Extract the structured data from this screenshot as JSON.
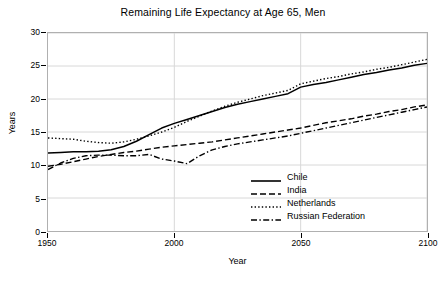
{
  "chart_data": {
    "type": "line",
    "title": "Remaining Life Expectancy at Age 65, Men",
    "xlabel": "Year",
    "ylabel": "Years",
    "xlim": [
      1950,
      2100
    ],
    "ylim": [
      0,
      30
    ],
    "xticks": [
      1950,
      2000,
      2050,
      2100
    ],
    "yticks": [
      0,
      5,
      10,
      15,
      20,
      25,
      30
    ],
    "grid": true,
    "legend_position": "lower right",
    "x": [
      1950,
      1955,
      1960,
      1965,
      1970,
      1975,
      1980,
      1985,
      1990,
      1995,
      2000,
      2005,
      2010,
      2015,
      2020,
      2025,
      2030,
      2035,
      2040,
      2045,
      2050,
      2055,
      2060,
      2065,
      2070,
      2075,
      2080,
      2085,
      2090,
      2095,
      2100
    ],
    "series": [
      {
        "name": "Chile",
        "style": "solid",
        "color": "#000000",
        "values": [
          11.8,
          11.9,
          12.0,
          12.0,
          12.1,
          12.3,
          12.8,
          13.6,
          14.6,
          15.6,
          16.3,
          16.9,
          17.5,
          18.1,
          18.7,
          19.2,
          19.6,
          20.0,
          20.4,
          20.8,
          21.8,
          22.2,
          22.5,
          22.9,
          23.3,
          23.7,
          24.0,
          24.4,
          24.7,
          25.1,
          25.4
        ]
      },
      {
        "name": "India",
        "style": "dashed",
        "color": "#000000",
        "values": [
          9.8,
          10.1,
          10.5,
          10.9,
          11.3,
          11.6,
          11.9,
          12.1,
          12.4,
          12.7,
          12.9,
          13.1,
          13.3,
          13.5,
          13.8,
          14.1,
          14.4,
          14.7,
          15.0,
          15.3,
          15.6,
          16.0,
          16.4,
          16.7,
          17.0,
          17.4,
          17.7,
          18.1,
          18.4,
          18.8,
          19.1
        ]
      },
      {
        "name": "Netherlands",
        "style": "dotted",
        "color": "#000000",
        "values": [
          14.1,
          14.0,
          13.9,
          13.6,
          13.4,
          13.3,
          13.5,
          13.9,
          14.4,
          15.0,
          15.7,
          16.6,
          17.4,
          18.2,
          18.9,
          19.5,
          20.0,
          20.5,
          20.9,
          21.3,
          22.3,
          22.7,
          23.1,
          23.4,
          23.8,
          24.1,
          24.5,
          24.8,
          25.2,
          25.6,
          26.0
        ]
      },
      {
        "name": "Russian Federation",
        "style": "dashdot",
        "color": "#000000",
        "values": [
          9.3,
          10.3,
          11.0,
          11.4,
          11.5,
          11.5,
          11.4,
          11.4,
          11.6,
          10.9,
          10.6,
          10.2,
          11.4,
          12.3,
          12.8,
          13.2,
          13.5,
          13.8,
          14.1,
          14.4,
          14.8,
          15.2,
          15.6,
          16.0,
          16.4,
          16.8,
          17.2,
          17.6,
          18.0,
          18.4,
          18.8
        ]
      }
    ]
  },
  "legend": {
    "items": [
      {
        "label": "Chile"
      },
      {
        "label": "India"
      },
      {
        "label": "Netherlands"
      },
      {
        "label": "Russian Federation"
      }
    ]
  }
}
